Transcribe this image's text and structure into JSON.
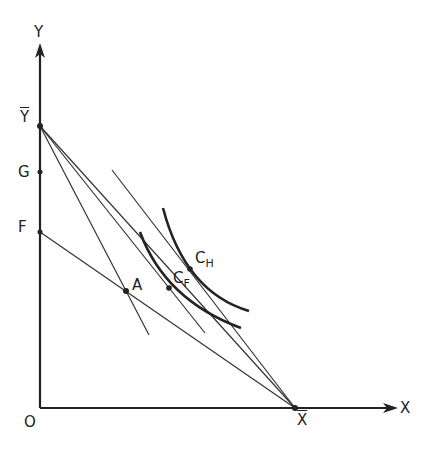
{
  "diagram": {
    "axes": {
      "x_label": "X",
      "y_label": "Y",
      "origin_label": "O"
    },
    "points": {
      "Y_bar": {
        "label": "Y",
        "bar": true
      },
      "G": {
        "label": "G"
      },
      "F": {
        "label": "F"
      },
      "X_bar": {
        "label": "X",
        "bar": true
      },
      "A": {
        "label": "A"
      },
      "C_F": {
        "label": "C",
        "sub": "F"
      },
      "C_H": {
        "label": "C",
        "sub": "H"
      }
    },
    "lines": [
      {
        "name": "Ybar-Xbar"
      },
      {
        "name": "F-Xbar"
      },
      {
        "name": "Ybar-A"
      },
      {
        "name": "Ybar-CF"
      },
      {
        "name": "tangent-CH-Xbar"
      }
    ],
    "curves": [
      {
        "name": "indifference-curve-CF"
      },
      {
        "name": "indifference-curve-CH"
      }
    ],
    "colors": {
      "ink": "#222222",
      "background": "#ffffff"
    }
  }
}
